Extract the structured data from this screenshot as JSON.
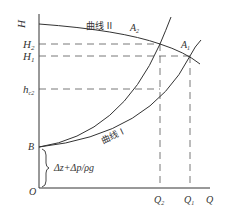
{
  "diagram": {
    "axes": {
      "y_label": "H",
      "x_label": "Q",
      "origin_label": "O"
    },
    "y_ticks": [
      {
        "label": "H",
        "sub": "",
        "y": 24
      },
      {
        "label": "H",
        "sub": "2",
        "y": 44
      },
      {
        "label": "H",
        "sub": "1",
        "y": 56
      },
      {
        "label": "h",
        "sub": "c2",
        "y": 89
      }
    ],
    "x_ticks": [
      {
        "label": "Q",
        "sub": "2",
        "x": 160
      },
      {
        "label": "Q",
        "sub": "1",
        "x": 190
      }
    ],
    "curves": {
      "curve_2_label": "曲线 II",
      "curve_1_label": "曲线 I"
    },
    "points": {
      "A1": {
        "label": "A",
        "sub": "1"
      },
      "A2": {
        "label": "A",
        "sub": "2"
      },
      "B": {
        "label": "B"
      }
    },
    "brace_annotation": "Δz+Δp/ρg",
    "colors": {
      "line": "#333333",
      "dash": "#555555"
    }
  }
}
